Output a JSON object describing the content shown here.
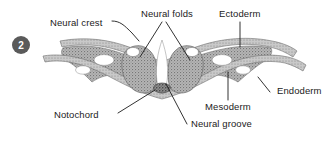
{
  "figure": {
    "panel_number": "2",
    "background_color": "#ffffff",
    "tissue_fill_color": "#9a9a9a",
    "tissue_outline_color": "#6b6b6b",
    "leader_line_color": "#1b1b1b",
    "text_color": "#1b1b1b",
    "badge_color": "#5a5a5a"
  },
  "labels": [
    {
      "id": "neural-crest",
      "text": "Neural crest",
      "x": 50,
      "y": 18
    },
    {
      "id": "neural-folds",
      "text": "Neural folds",
      "x": 141,
      "y": 9
    },
    {
      "id": "ectoderm",
      "text": "Ectoderm",
      "x": 219,
      "y": 9
    },
    {
      "id": "endoderm",
      "text": "Endoderm",
      "x": 272,
      "y": 89
    },
    {
      "id": "mesoderm",
      "text": "Mesoderm",
      "x": 205,
      "y": 104
    },
    {
      "id": "notochord",
      "text": "Notochord",
      "x": 54,
      "y": 110
    },
    {
      "id": "neural-groove",
      "text": "Neural groove",
      "x": 189,
      "y": 121
    }
  ],
  "structures": [
    "ectoderm",
    "mesoderm",
    "endoderm",
    "notochord",
    "neural folds",
    "neural groove",
    "neural crest"
  ]
}
